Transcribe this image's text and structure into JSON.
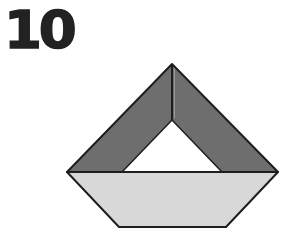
{
  "step": {
    "number": "10"
  },
  "figure": {
    "colors": {
      "dark_fold": "#6e6e6e",
      "light_fold": "#d8d8d8",
      "inner_gap": "#ffffff",
      "outline": "#1e1e1e"
    },
    "outer_triangle": {
      "apex": [
        172,
        64
      ],
      "left": [
        67,
        172
      ],
      "right": [
        278,
        172
      ]
    },
    "inner_triangle": {
      "apex": [
        172,
        120
      ],
      "left": [
        122,
        172
      ],
      "right": [
        222,
        172
      ]
    },
    "hull": {
      "top_left": [
        67,
        172
      ],
      "top_right": [
        278,
        172
      ],
      "bottom_right": [
        226,
        227
      ],
      "bottom_left": [
        119,
        227
      ]
    }
  }
}
